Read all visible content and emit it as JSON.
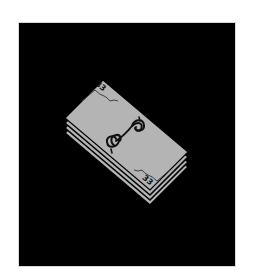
{
  "image": {
    "subject": "money-stack-icon",
    "background_color": "#000000",
    "frame_border_color": "#d8d8d8"
  },
  "bill": {
    "color": "#b4b4b4",
    "ink_color": "#111111",
    "denomination_top": "33",
    "denomination_bottom": "33",
    "center_symbol": "$",
    "corners": {
      "top": [
        103,
        80
      ],
      "right": [
        188,
        152
      ],
      "bottom": [
        150,
        190
      ],
      "left": [
        65,
        118
      ]
    },
    "stack_offsets_px": [
      5,
      10,
      15
    ]
  }
}
